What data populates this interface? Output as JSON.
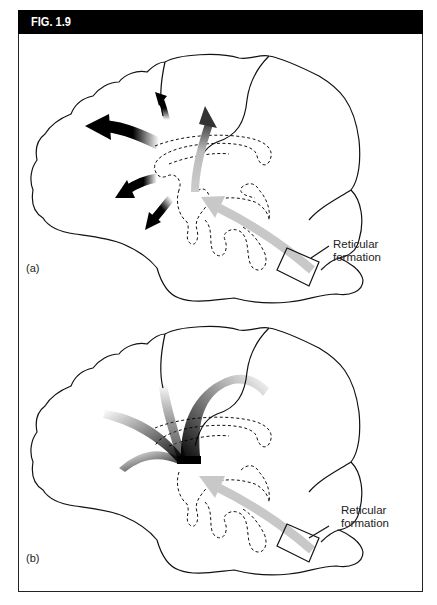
{
  "figure": {
    "title": "FIG. 1.9",
    "panels": [
      {
        "id": "a",
        "label": "(a)",
        "callout_line1": "Reticular",
        "callout_line2": "formation",
        "description": "Brain (sagittal view) with grey ascending arrow from reticular formation, black arrows projecting diffusely to cortex"
      },
      {
        "id": "b",
        "label": "(b)",
        "callout_line1": "Reticular",
        "callout_line2": "formation",
        "description": "Brain (sagittal view) with grey ascending arrow from reticular formation converging on a point, then gradient fans spreading to cortex"
      }
    ]
  },
  "colors": {
    "header_bg": "#000000",
    "header_text": "#ffffff",
    "outline": "#111111",
    "ascending_arrow": "#c8c8c8",
    "projection_arrow": "#000000"
  }
}
